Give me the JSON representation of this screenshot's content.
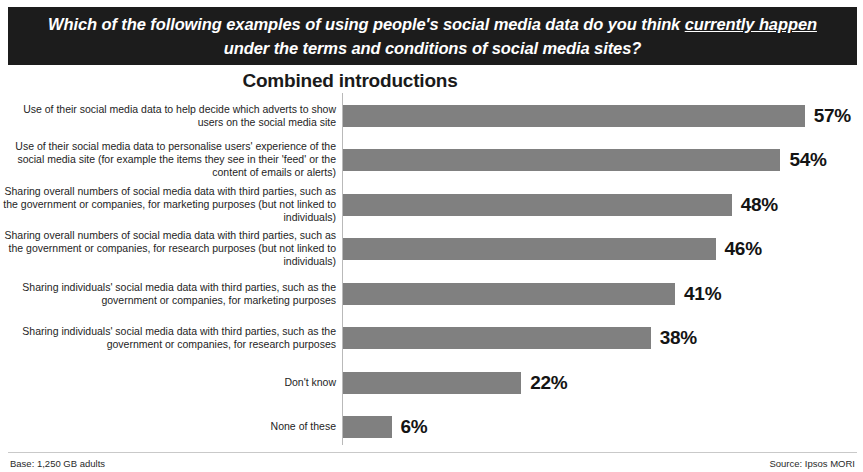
{
  "banner": {
    "question_before": "Which of the following examples of using people's social media data do you think ",
    "question_emphasis": "currently happen",
    "question_after": " under the terms and conditions of social media sites?"
  },
  "footer": {
    "base": "Base: 1,250 GB adults",
    "source": "Source: Ipsos MORI"
  },
  "chart_data": {
    "type": "bar",
    "title": "Combined introductions",
    "xlabel": "",
    "ylabel": "",
    "orientation": "horizontal",
    "grid": false,
    "legend": false,
    "xlim": [
      0,
      60
    ],
    "bar_color": "#808080",
    "categories": [
      "Use of their social media data to help decide which adverts to show users on the social media site",
      "Use of their social media data to personalise users' experience of the social media site (for example the items they see in their 'feed' or the content of emails or alerts)",
      "Sharing overall numbers of social media data with third parties, such as the government or companies, for marketing purposes (but not linked to individuals)",
      "Sharing overall numbers of social media data with third parties, such as the government or companies, for research purposes (but not linked to individuals)",
      "Sharing individuals' social media data with third parties, such as the government or companies, for marketing purposes",
      "Sharing individuals' social media data with third parties, such as the government or companies, for research purposes",
      "Don't know",
      "None of these"
    ],
    "values": [
      57,
      54,
      48,
      46,
      41,
      38,
      22,
      6
    ],
    "value_labels": [
      "57%",
      "54%",
      "48%",
      "46%",
      "41%",
      "38%",
      "22%",
      "6%"
    ]
  }
}
